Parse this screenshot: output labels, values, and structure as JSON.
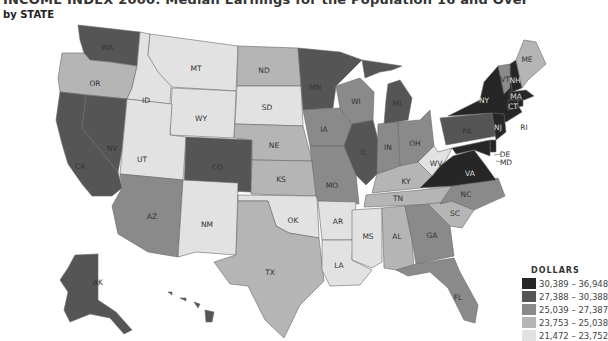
{
  "title": "INCOME INDEX 2000: Median Earnings for the Population 16 and Over",
  "subtitle": "by STATE",
  "legend": {
    "title": "DOLLARS",
    "bins": [
      {
        "label": "30,389 – 36,948",
        "color": "#262626"
      },
      {
        "label": "27,388 – 30,388",
        "color": "#555555"
      },
      {
        "label": "25,039 – 27,387",
        "color": "#8a8a8a"
      },
      {
        "label": "23,753 – 25,038",
        "color": "#b5b5b5"
      },
      {
        "label": "21,472 – 23,752",
        "color": "#e2e2e2"
      }
    ]
  },
  "states": {
    "WA": 1,
    "OR": 3,
    "CA": 1,
    "NV": 1,
    "ID": 4,
    "MT": 4,
    "WY": 4,
    "UT": 4,
    "CO": 1,
    "AZ": 2,
    "NM": 4,
    "ND": 3,
    "SD": 4,
    "NE": 3,
    "KS": 3,
    "OK": 4,
    "TX": 3,
    "MN": 1,
    "IA": 2,
    "MO": 2,
    "AR": 4,
    "LA": 4,
    "WI": 2,
    "IL": 1,
    "MI": 1,
    "IN": 2,
    "OH": 2,
    "KY": 3,
    "TN": 3,
    "MS": 4,
    "AL": 3,
    "GA": 2,
    "FL": 2,
    "SC": 3,
    "NC": 2,
    "VA": 0,
    "WV": 4,
    "PA": 1,
    "NY": 0,
    "VT": 2,
    "NH": 0,
    "ME": 3,
    "MA": 0,
    "CT": 0,
    "RI": 0,
    "NJ": 0,
    "DE": 0,
    "MD": 0,
    "AK": 1,
    "HI": 1
  }
}
